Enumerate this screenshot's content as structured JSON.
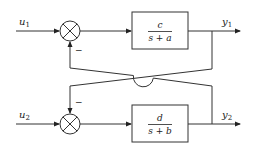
{
  "diagram": {
    "type": "block-diagram",
    "inputs": [
      {
        "label": "u",
        "sub": "1"
      },
      {
        "label": "u",
        "sub": "2"
      }
    ],
    "outputs": [
      {
        "label": "y",
        "sub": "1"
      },
      {
        "label": "y",
        "sub": "2"
      }
    ],
    "blocks": [
      {
        "numerator": "c",
        "denominator": "s + a"
      },
      {
        "numerator": "d",
        "denominator": "s + b"
      }
    ],
    "summing_junctions": [
      {
        "feedback_sign": "−"
      },
      {
        "feedback_sign": "−"
      }
    ],
    "connections": [
      "u1 -> sum1",
      "sum1 -> block1",
      "block1 -> y1",
      "u2 -> sum2",
      "sum2 -> block2",
      "block2 -> y2",
      "y1 -> sum2 (negative)",
      "y2 -> sum1 (negative)"
    ]
  }
}
